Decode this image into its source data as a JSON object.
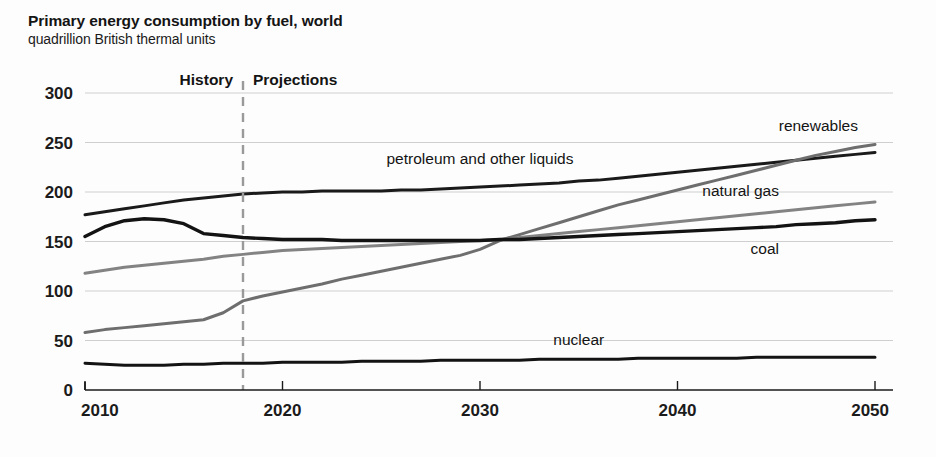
{
  "title": "Primary energy consumption by fuel, world",
  "subtitle": "quadrillion British thermal units",
  "annotations": {
    "history": "History",
    "projections": "Projections"
  },
  "chart_data": {
    "type": "line",
    "title": "Primary energy consumption by fuel, world",
    "subtitle": "quadrillion British thermal units",
    "xlabel": "",
    "ylabel": "quadrillion British thermal units",
    "xlim": [
      2010,
      2050
    ],
    "ylim": [
      0,
      300
    ],
    "xticks": [
      2010,
      2020,
      2030,
      2040,
      2050
    ],
    "yticks": [
      0,
      50,
      100,
      150,
      200,
      250,
      300
    ],
    "grid": true,
    "legend_position": "inline-labels",
    "history_projection_split": 2018,
    "x": [
      2010,
      2011,
      2012,
      2013,
      2014,
      2015,
      2016,
      2017,
      2018,
      2019,
      2020,
      2021,
      2022,
      2023,
      2024,
      2025,
      2026,
      2027,
      2028,
      2029,
      2030,
      2031,
      2032,
      2033,
      2034,
      2035,
      2036,
      2037,
      2038,
      2039,
      2040,
      2041,
      2042,
      2043,
      2044,
      2045,
      2046,
      2047,
      2048,
      2049,
      2050
    ],
    "series": [
      {
        "name": "petroleum and other liquids",
        "color": "#1a1a1a",
        "width": 3.0,
        "label_x": 2030,
        "label_y": 228,
        "values": [
          177,
          180,
          183,
          186,
          189,
          192,
          194,
          196,
          198,
          199,
          200,
          200,
          201,
          201,
          201,
          201,
          202,
          202,
          203,
          204,
          205,
          206,
          207,
          208,
          209,
          211,
          212,
          214,
          216,
          218,
          220,
          222,
          224,
          226,
          228,
          230,
          232,
          234,
          236,
          238,
          240
        ]
      },
      {
        "name": "renewables",
        "color": "#6e6e6e",
        "width": 3.0,
        "label_x": 2046,
        "label_y": 262,
        "values": [
          58,
          61,
          63,
          65,
          67,
          69,
          71,
          78,
          90,
          95,
          99,
          103,
          107,
          112,
          116,
          120,
          124,
          128,
          132,
          136,
          142,
          151,
          157,
          163,
          169,
          175,
          181,
          187,
          192,
          197,
          202,
          207,
          212,
          217,
          222,
          227,
          232,
          237,
          241,
          245,
          248
        ]
      },
      {
        "name": "natural gas",
        "color": "#838383",
        "width": 3.0,
        "label_x": 2042,
        "label_y": 196,
        "values": [
          118,
          121,
          124,
          126,
          128,
          130,
          132,
          135,
          137,
          139,
          141,
          142,
          143,
          144,
          145,
          146,
          147,
          148,
          149,
          150,
          151,
          152,
          154,
          156,
          158,
          160,
          162,
          164,
          166,
          168,
          170,
          172,
          174,
          176,
          178,
          180,
          182,
          184,
          186,
          188,
          190
        ]
      },
      {
        "name": "coal",
        "color": "#131313",
        "width": 3.4,
        "label_x": 2042,
        "label_y": 137,
        "values": [
          155,
          165,
          171,
          173,
          172,
          168,
          158,
          156,
          154,
          153,
          152,
          152,
          152,
          151,
          151,
          151,
          151,
          151,
          151,
          151,
          151,
          152,
          152,
          153,
          154,
          155,
          156,
          157,
          158,
          159,
          160,
          161,
          162,
          163,
          164,
          165,
          167,
          168,
          169,
          171,
          172
        ]
      },
      {
        "name": "nuclear",
        "color": "#131313",
        "width": 3.0,
        "label_x": 2035,
        "label_y": 45,
        "values": [
          27,
          26,
          25,
          25,
          25,
          26,
          26,
          27,
          27,
          27,
          28,
          28,
          28,
          28,
          29,
          29,
          29,
          29,
          30,
          30,
          30,
          30,
          30,
          31,
          31,
          31,
          31,
          31,
          32,
          32,
          32,
          32,
          32,
          32,
          33,
          33,
          33,
          33,
          33,
          33,
          33
        ]
      }
    ]
  }
}
